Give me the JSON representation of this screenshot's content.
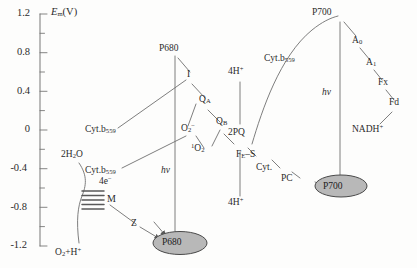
{
  "diagram": {
    "type": "z-scheme-photosynthetic-electron-transport",
    "axis": {
      "label": "Em(V)",
      "label_base": "E",
      "label_sub": "m",
      "label_unit": "(V)",
      "ticks_major": [
        "1.2",
        "0.8",
        "0.4",
        "0",
        "-0.4",
        "-0.8",
        "-1.2"
      ],
      "tick_values": [
        1.2,
        0.8,
        0.4,
        0,
        -0.4,
        -0.8,
        -1.2
      ],
      "range": [
        -1.2,
        1.2
      ],
      "minor_ticks_between": 1
    },
    "photosystem_II": {
      "reaction_center_top": "P680",
      "reaction_center_oval": "P680",
      "photon": "hv",
      "donor_side": {
        "water": "2H2O",
        "electrons": "4e-",
        "manganese_cluster": "M",
        "products": "O2+H+",
        "tyrosine": "Z"
      },
      "acceptors": [
        "I",
        "QA",
        "QB"
      ],
      "side_branches": [
        "Cyt.b559",
        "Cyt.b559",
        "O2-",
        "1O2"
      ]
    },
    "intersystem_chain": {
      "plastoquinone": "2PQ",
      "protons_in": "4H+",
      "protons_out": "4H+",
      "cytochrome_b": "Cyt.b559",
      "iron_sulfur": "FE-S",
      "cytochrome": "Cyt.",
      "plastocyanin": "PC"
    },
    "photosystem_I": {
      "reaction_center_top": "P700",
      "reaction_center_oval": "P700",
      "photon": "hv",
      "acceptors": [
        "A0",
        "A1",
        "Fx",
        "Fd"
      ],
      "terminal": "NADH+"
    },
    "colors": {
      "line": "#6b6b6b",
      "text": "#2b2b2b",
      "oval_fill": "#b8b8b8",
      "oval_stroke": "#4a4a4a",
      "background": "#fdfdfc"
    }
  }
}
